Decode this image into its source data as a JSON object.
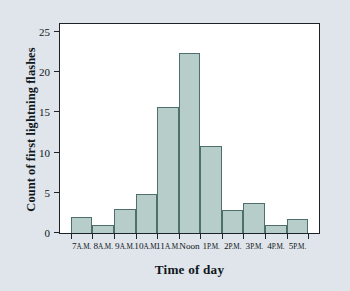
{
  "chart_data": {
    "type": "bar",
    "title": "",
    "xlabel": "Time of day",
    "ylabel": "Count of first lightning flashes",
    "categories": [
      "7 A.M.",
      "8 A.M.",
      "9 A.M.",
      "10 A.M.",
      "11 A.M.",
      "Noon",
      "1 P.M.",
      "2 P.M.",
      "3 P.M.",
      "4 P.M.",
      "5 P.M."
    ],
    "category_parts": [
      {
        "hour": "7",
        "meridiem": "A.M."
      },
      {
        "hour": "8",
        "meridiem": "A.M."
      },
      {
        "hour": "9",
        "meridiem": "A.M."
      },
      {
        "hour": "10",
        "meridiem": "A.M."
      },
      {
        "hour": "11",
        "meridiem": "A.M."
      },
      {
        "hour": "Noon",
        "meridiem": ""
      },
      {
        "hour": "1",
        "meridiem": "P.M."
      },
      {
        "hour": "2",
        "meridiem": "P.M."
      },
      {
        "hour": "3",
        "meridiem": "P.M."
      },
      {
        "hour": "4",
        "meridiem": "P.M."
      },
      {
        "hour": "5",
        "meridiem": "P.M."
      }
    ],
    "values": [
      2,
      1,
      3,
      4.8,
      15.7,
      22.4,
      10.8,
      2.9,
      3.7,
      1,
      1.7
    ],
    "ylim": [
      0,
      26
    ],
    "yticks": [
      0,
      5,
      10,
      15,
      20,
      25
    ],
    "ytick_labels": [
      "0",
      "5",
      "10",
      "15",
      "20",
      "25"
    ],
    "grid": false,
    "legend": null,
    "bar_color": "#b6cdc9",
    "bar_edge_color": "#4f6f6c",
    "axis_color": "#1b2228",
    "plot_background": "#ffffff",
    "figure_background": "#dfe5ea"
  }
}
